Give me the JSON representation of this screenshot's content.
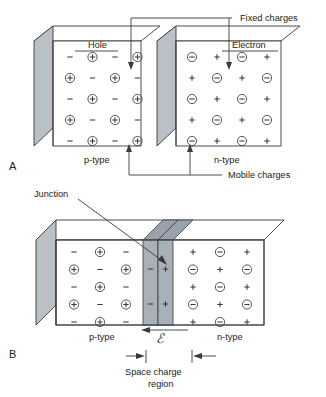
{
  "figure": {
    "colors": {
      "face_fill": "#ffffff",
      "side_shade": "#b9c0c6",
      "depletion_shade": "#a8b0b8",
      "depletion_top": "#9aa3ab",
      "stroke": "#3a3a3a",
      "text": "#1a1a1a"
    }
  },
  "panels": [
    {
      "id": "A",
      "letter": "A",
      "labels": {
        "fixed_charges": "Fixed charges",
        "mobile_charges": "Mobile charges",
        "hole": "Hole",
        "electron": "Electron",
        "p_type": "p-type",
        "n_type": "n-type"
      },
      "p_block": {
        "name": "p-type",
        "rows": 5,
        "cols": 4,
        "grid": [
          [
            "minus-bare",
            "plus-circled",
            "minus-bare",
            "plus-circled"
          ],
          [
            "plus-circled",
            "minus-bare",
            "plus-circled",
            "minus-bare"
          ],
          [
            "minus-bare",
            "plus-circled",
            "minus-bare",
            "plus-circled"
          ],
          [
            "plus-circled",
            "minus-bare",
            "plus-circled",
            "minus-bare"
          ],
          [
            "minus-bare",
            "plus-circled",
            "minus-bare",
            "plus-circled"
          ]
        ]
      },
      "n_block": {
        "name": "n-type",
        "rows": 5,
        "cols": 4,
        "grid": [
          [
            "minus-circled",
            "plus-bare",
            "minus-circled",
            "plus-bare"
          ],
          [
            "plus-bare",
            "minus-circled",
            "plus-bare",
            "minus-circled"
          ],
          [
            "minus-circled",
            "plus-bare",
            "minus-circled",
            "plus-bare"
          ],
          [
            "plus-bare",
            "minus-circled",
            "plus-bare",
            "minus-circled"
          ],
          [
            "minus-circled",
            "plus-bare",
            "minus-circled",
            "plus-bare"
          ]
        ]
      }
    },
    {
      "id": "B",
      "letter": "B",
      "labels": {
        "junction": "Junction",
        "p_type": "p-type",
        "n_type": "n-type",
        "space_charge": "Space charge",
        "region": "region",
        "e_field": "ℰ"
      },
      "p_block": {
        "name": "p-type",
        "rows": 5,
        "cols": 3,
        "grid": [
          [
            "minus-bare",
            "plus-circled",
            "minus-bare"
          ],
          [
            "plus-circled",
            "minus-bare",
            "plus-circled"
          ],
          [
            "minus-bare",
            "plus-circled",
            "minus-bare"
          ],
          [
            "plus-circled",
            "minus-bare",
            "plus-circled"
          ],
          [
            "minus-bare",
            "plus-circled",
            "minus-bare"
          ]
        ]
      },
      "depletion": {
        "name": "space-charge-region",
        "left_column": [
          "minus-bare",
          "minus-bare"
        ],
        "right_column": [
          "plus-bare",
          "plus-bare"
        ]
      },
      "n_block": {
        "name": "n-type",
        "rows": 5,
        "cols": 3,
        "grid": [
          [
            "plus-bare",
            "minus-circled",
            "plus-bare"
          ],
          [
            "minus-circled",
            "plus-bare",
            "minus-circled"
          ],
          [
            "plus-bare",
            "minus-circled",
            "plus-bare"
          ],
          [
            "minus-circled",
            "plus-bare",
            "minus-circled"
          ],
          [
            "plus-bare",
            "minus-circled",
            "plus-bare"
          ]
        ]
      }
    }
  ]
}
